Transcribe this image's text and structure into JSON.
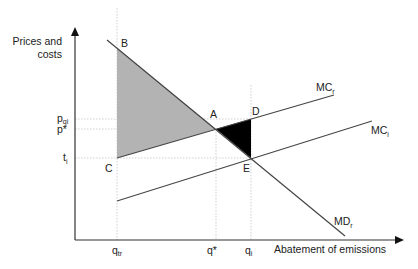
{
  "axes": {
    "y_label_line1": "Prices and",
    "y_label_line2": "costs",
    "x_label": "Abatement of emissions"
  },
  "points": {
    "A": "A",
    "B": "B",
    "C": "C",
    "D": "D",
    "E": "E"
  },
  "curves": {
    "mcr": {
      "label": "MC",
      "sub": "r"
    },
    "mci": {
      "label": "MC",
      "sub": "i"
    },
    "mdr": {
      "label": "MD",
      "sub": "r"
    }
  },
  "y_ticks": {
    "pqi": {
      "label": "p",
      "sub": "qi"
    },
    "pstar": {
      "label": "p*"
    },
    "ti": {
      "label": "t",
      "sub": "i"
    }
  },
  "x_ticks": {
    "qtr": {
      "label": "q",
      "sub": "tr"
    },
    "qstar": {
      "label": "q*"
    },
    "qi": {
      "label": "q",
      "sub": "i"
    }
  },
  "colors": {
    "axis": "#333333",
    "curve": "#444444",
    "guide": "#cccccc",
    "shade_gray": "#b3b3b3",
    "shade_black": "#000000"
  }
}
